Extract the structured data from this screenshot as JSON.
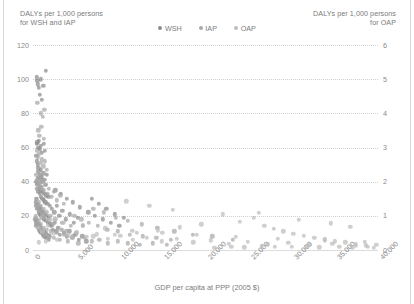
{
  "chart_data": {
    "type": "scatter",
    "title": "",
    "xlabel": "GDP per capita at PPP (2005 $)",
    "ylabel_left": "DALYs per 1,000 persons\nfor WSH and IAP",
    "ylabel_right": "DALYs per 1,000 persons\nfor OAP",
    "xlim": [
      0,
      40000
    ],
    "ylim_left": [
      0,
      120
    ],
    "ylim_right": [
      0,
      6
    ],
    "xticks": [
      "0",
      "5,000",
      "10,000",
      "15,000",
      "20,000",
      "25,000",
      "30,000",
      "35,000",
      "40,000"
    ],
    "xtick_values": [
      0,
      5000,
      10000,
      15000,
      20000,
      25000,
      30000,
      35000,
      40000
    ],
    "yticks_left": [
      "0",
      "20",
      "40",
      "60",
      "80",
      "100",
      "120"
    ],
    "ytick_left_values": [
      0,
      20,
      40,
      60,
      80,
      100,
      120
    ],
    "yticks_right": [
      "0",
      "1",
      "2",
      "3",
      "4",
      "5",
      "6"
    ],
    "ytick_right_values": [
      0,
      1,
      2,
      3,
      4,
      5,
      6
    ],
    "grid": true,
    "legend_position": "top-center",
    "colors": {
      "WSH": "#8c8c8c",
      "IAP": "#a8a8a8",
      "OAP": "#bdbdbd",
      "grid": "#d0d0d0",
      "text": "#7b7b7b"
    },
    "series": [
      {
        "name": "WSH",
        "axis": "left",
        "color": "#8c8c8c",
        "points": [
          [
            420,
            101
          ],
          [
            500,
            99
          ],
          [
            560,
            97
          ],
          [
            640,
            95
          ],
          [
            900,
            100
          ],
          [
            1500,
            105
          ],
          [
            1180,
            96
          ],
          [
            760,
            91
          ],
          [
            1000,
            88
          ],
          [
            430,
            62
          ],
          [
            520,
            63
          ],
          [
            610,
            60
          ],
          [
            700,
            64
          ],
          [
            820,
            59
          ],
          [
            900,
            61
          ],
          [
            1050,
            57
          ],
          [
            1250,
            62
          ],
          [
            1400,
            58
          ],
          [
            380,
            55
          ],
          [
            460,
            52
          ],
          [
            540,
            50
          ],
          [
            620,
            48
          ],
          [
            700,
            46
          ],
          [
            780,
            44
          ],
          [
            860,
            42
          ],
          [
            940,
            47
          ],
          [
            1020,
            43
          ],
          [
            1100,
            40
          ],
          [
            1200,
            45
          ],
          [
            1330,
            41
          ],
          [
            1480,
            38
          ],
          [
            1600,
            44
          ],
          [
            350,
            40
          ],
          [
            420,
            38
          ],
          [
            490,
            36
          ],
          [
            560,
            42
          ],
          [
            630,
            34
          ],
          [
            700,
            39
          ],
          [
            770,
            33
          ],
          [
            840,
            37
          ],
          [
            910,
            31
          ],
          [
            980,
            35
          ],
          [
            1060,
            30
          ],
          [
            1140,
            34
          ],
          [
            1230,
            29
          ],
          [
            1320,
            33
          ],
          [
            1420,
            28
          ],
          [
            1530,
            32
          ],
          [
            1650,
            27
          ],
          [
            1780,
            31
          ],
          [
            1920,
            26
          ],
          [
            300,
            28
          ],
          [
            370,
            26
          ],
          [
            440,
            30
          ],
          [
            510,
            24
          ],
          [
            580,
            27
          ],
          [
            650,
            22
          ],
          [
            720,
            25
          ],
          [
            790,
            21
          ],
          [
            860,
            24
          ],
          [
            930,
            20
          ],
          [
            1000,
            23
          ],
          [
            1080,
            19
          ],
          [
            1160,
            22
          ],
          [
            1250,
            18
          ],
          [
            1350,
            21
          ],
          [
            1460,
            17
          ],
          [
            1580,
            20
          ],
          [
            1710,
            16
          ],
          [
            1850,
            19
          ],
          [
            2000,
            15
          ],
          [
            280,
            18
          ],
          [
            340,
            16
          ],
          [
            400,
            14
          ],
          [
            470,
            17
          ],
          [
            540,
            13
          ],
          [
            610,
            15
          ],
          [
            680,
            12
          ],
          [
            750,
            14
          ],
          [
            820,
            11
          ],
          [
            890,
            13
          ],
          [
            960,
            10
          ],
          [
            1040,
            12
          ],
          [
            1120,
            9
          ],
          [
            1210,
            11
          ],
          [
            1310,
            8
          ],
          [
            1420,
            10
          ],
          [
            1540,
            7
          ],
          [
            1670,
            9
          ],
          [
            1810,
            6
          ],
          [
            1960,
            8
          ],
          [
            2120,
            14
          ],
          [
            2300,
            12
          ],
          [
            2500,
            16
          ],
          [
            2700,
            11
          ],
          [
            2900,
            13
          ],
          [
            3100,
            9
          ],
          [
            3350,
            12
          ],
          [
            3600,
            10
          ],
          [
            3900,
            8
          ],
          [
            4200,
            11
          ],
          [
            4550,
            7
          ],
          [
            4900,
            9
          ],
          [
            5300,
            6
          ],
          [
            5700,
            8
          ],
          [
            6200,
            5
          ],
          [
            2200,
            24
          ],
          [
            2450,
            22
          ],
          [
            2750,
            26
          ],
          [
            3050,
            20
          ],
          [
            3400,
            23
          ],
          [
            3800,
            18
          ],
          [
            4250,
            21
          ],
          [
            4700,
            16
          ],
          [
            5200,
            19
          ],
          [
            5800,
            14
          ],
          [
            2600,
            35
          ],
          [
            3200,
            33
          ],
          [
            3900,
            30
          ],
          [
            4600,
            28
          ],
          [
            5400,
            25
          ],
          [
            6400,
            22
          ],
          [
            7200,
            20
          ],
          [
            8100,
            18
          ],
          [
            9000,
            16
          ],
          [
            10000,
            14
          ],
          [
            6800,
            30
          ],
          [
            7600,
            27
          ],
          [
            8500,
            24
          ],
          [
            9500,
            21
          ],
          [
            10500,
            19
          ]
        ]
      },
      {
        "name": "IAP",
        "axis": "left",
        "color": "#a8a8a8",
        "points": [
          [
            520,
            86
          ],
          [
            880,
            80
          ],
          [
            1150,
            78
          ],
          [
            1320,
            82
          ],
          [
            600,
            70
          ],
          [
            740,
            67
          ],
          [
            980,
            72
          ],
          [
            1240,
            65
          ],
          [
            420,
            58
          ],
          [
            560,
            54
          ],
          [
            700,
            56
          ],
          [
            840,
            51
          ],
          [
            1000,
            53
          ],
          [
            1180,
            49
          ],
          [
            1400,
            52
          ],
          [
            1620,
            47
          ],
          [
            380,
            44
          ],
          [
            480,
            41
          ],
          [
            590,
            46
          ],
          [
            710,
            39
          ],
          [
            830,
            43
          ],
          [
            960,
            37
          ],
          [
            1100,
            40
          ],
          [
            1260,
            35
          ],
          [
            1440,
            38
          ],
          [
            1640,
            33
          ],
          [
            1860,
            36
          ],
          [
            2100,
            31
          ],
          [
            2400,
            34
          ],
          [
            2750,
            29
          ],
          [
            3150,
            32
          ],
          [
            3600,
            27
          ],
          [
            340,
            30
          ],
          [
            430,
            27
          ],
          [
            530,
            25
          ],
          [
            640,
            28
          ],
          [
            760,
            23
          ],
          [
            890,
            26
          ],
          [
            1030,
            21
          ],
          [
            1180,
            24
          ],
          [
            1350,
            19
          ],
          [
            1540,
            22
          ],
          [
            1760,
            17
          ],
          [
            2000,
            20
          ],
          [
            2280,
            15
          ],
          [
            2600,
            18
          ],
          [
            2960,
            13
          ],
          [
            3380,
            16
          ],
          [
            3850,
            11
          ],
          [
            4400,
            14
          ],
          [
            5000,
            10
          ],
          [
            300,
            20
          ],
          [
            380,
            18
          ],
          [
            470,
            16
          ],
          [
            570,
            14
          ],
          [
            680,
            17
          ],
          [
            800,
            12
          ],
          [
            930,
            15
          ],
          [
            1080,
            10
          ],
          [
            1240,
            13
          ],
          [
            1420,
            9
          ],
          [
            1620,
            12
          ],
          [
            1850,
            8
          ],
          [
            2100,
            11
          ],
          [
            2400,
            7
          ],
          [
            2740,
            10
          ],
          [
            3120,
            6
          ],
          [
            3550,
            9
          ],
          [
            4050,
            5
          ],
          [
            4600,
            8
          ],
          [
            5250,
            4
          ],
          [
            6000,
            7
          ],
          [
            6800,
            5
          ],
          [
            7700,
            6
          ],
          [
            8700,
            4
          ],
          [
            9800,
            5
          ],
          [
            11000,
            4
          ],
          [
            12400,
            3
          ],
          [
            13900,
            4
          ],
          [
            15500,
            3
          ],
          [
            4800,
            20
          ],
          [
            5600,
            18
          ],
          [
            6500,
            16
          ],
          [
            7500,
            14
          ],
          [
            8600,
            12
          ],
          [
            9800,
            11
          ],
          [
            11200,
            9
          ],
          [
            12700,
            8
          ],
          [
            14300,
            7
          ],
          [
            16000,
            6
          ],
          [
            7000,
            24
          ],
          [
            8200,
            22
          ],
          [
            9600,
            19
          ],
          [
            11000,
            17
          ],
          [
            12600,
            15
          ],
          [
            14400,
            13
          ],
          [
            16400,
            11
          ],
          [
            18500,
            9
          ],
          [
            20800,
            8
          ],
          [
            23200,
            6
          ]
        ]
      },
      {
        "name": "OAP",
        "axis": "right",
        "color": "#bdbdbd",
        "points": [
          [
            600,
            0.65
          ],
          [
            1100,
            0.55
          ],
          [
            1700,
            0.7
          ],
          [
            2400,
            0.48
          ],
          [
            3200,
            0.6
          ],
          [
            4100,
            0.42
          ],
          [
            5100,
            0.52
          ],
          [
            6200,
            0.38
          ],
          [
            7400,
            0.46
          ],
          [
            8700,
            0.33
          ],
          [
            10100,
            0.41
          ],
          [
            11600,
            0.29
          ],
          [
            13200,
            0.36
          ],
          [
            14900,
            0.25
          ],
          [
            16700,
            0.32
          ],
          [
            18600,
            0.22
          ],
          [
            20600,
            0.28
          ],
          [
            22700,
            0.19
          ],
          [
            24900,
            0.24
          ],
          [
            27200,
            0.17
          ],
          [
            29600,
            0.21
          ],
          [
            32100,
            0.15
          ],
          [
            34700,
            0.18
          ],
          [
            37400,
            0.13
          ],
          [
            39800,
            0.16
          ],
          [
            900,
            0.95
          ],
          [
            2000,
            0.88
          ],
          [
            3600,
            0.8
          ],
          [
            5800,
            0.72
          ],
          [
            8400,
            0.64
          ],
          [
            11500,
            0.56
          ],
          [
            15000,
            0.5
          ],
          [
            19000,
            0.44
          ],
          [
            23500,
            0.38
          ],
          [
            28400,
            0.33
          ],
          [
            33800,
            0.28
          ],
          [
            38500,
            0.24
          ],
          [
            25600,
            0.95
          ],
          [
            26800,
            0.7
          ],
          [
            27900,
            0.62
          ],
          [
            29000,
            0.55
          ],
          [
            30200,
            0.48
          ],
          [
            31400,
            0.42
          ],
          [
            32600,
            0.36
          ],
          [
            33800,
            0.31
          ],
          [
            35000,
            0.26
          ],
          [
            36200,
            0.22
          ],
          [
            37400,
            0.18
          ],
          [
            38600,
            0.14
          ],
          [
            26200,
            1.08
          ],
          [
            30800,
            0.88
          ],
          [
            34500,
            0.78
          ],
          [
            36800,
            0.68
          ],
          [
            22000,
            1.05
          ],
          [
            24000,
            0.82
          ],
          [
            19500,
            0.75
          ],
          [
            17000,
            0.66
          ],
          [
            14500,
            0.58
          ],
          [
            12000,
            0.5
          ],
          [
            9500,
            0.44
          ],
          [
            7000,
            0.4
          ],
          [
            4500,
            0.35
          ],
          [
            2800,
            0.3
          ],
          [
            1500,
            0.26
          ],
          [
            700,
            0.22
          ],
          [
            26500,
            0.12
          ],
          [
            28000,
            0.1
          ],
          [
            30000,
            0.09
          ],
          [
            31800,
            0.11
          ],
          [
            33200,
            0.08
          ],
          [
            35500,
            0.1
          ],
          [
            37000,
            0.07
          ],
          [
            38800,
            0.09
          ],
          [
            39500,
            0.06
          ],
          [
            24500,
            0.08
          ],
          [
            23000,
            0.1
          ],
          [
            21000,
            0.07
          ],
          [
            13500,
            1.3
          ],
          [
            16200,
            1.18
          ],
          [
            10800,
            1.42
          ]
        ]
      }
    ]
  }
}
